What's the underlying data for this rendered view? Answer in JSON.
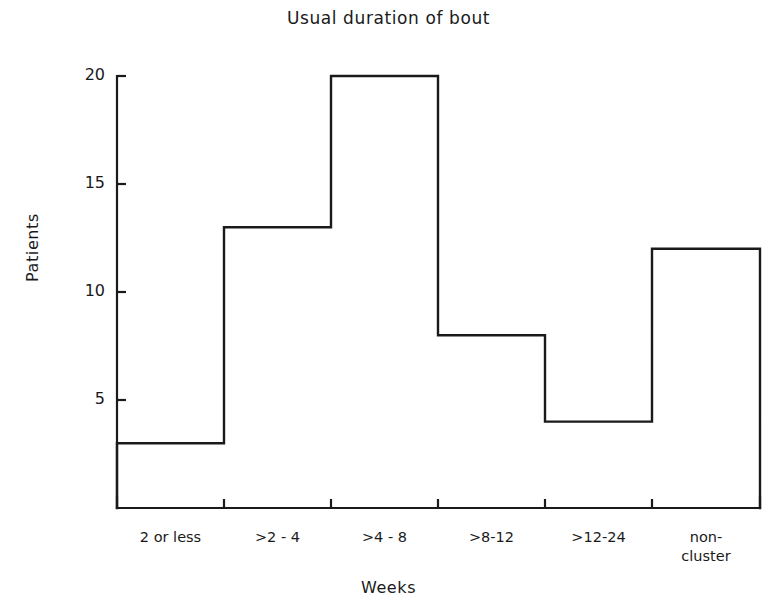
{
  "chart_data": {
    "type": "bar",
    "render_style": "step-outline-histogram",
    "title": "Usual duration of bout",
    "xlabel": "Weeks",
    "ylabel": "Patients",
    "categories": [
      "2 or less",
      ">2 - 4",
      ">4 - 8",
      ">8-12",
      ">12-24",
      "non-\ncluster"
    ],
    "values": [
      3,
      13,
      20,
      8,
      4,
      12
    ],
    "ylim": [
      0,
      20.5
    ],
    "yticks": [
      5,
      10,
      15,
      20
    ],
    "ytick_labels": [
      "5",
      "10",
      "15",
      "20"
    ],
    "grid": false,
    "legend": null,
    "line_color": "#1a1a1a",
    "fill_color": "none",
    "background_color": "#ffffff"
  },
  "geometry": {
    "x_edges": [
      117,
      224,
      331,
      438,
      545,
      652,
      760
    ],
    "y_baseline": 508,
    "y_top_axis": 76,
    "px_per_unit": 21.6,
    "tick_inner_length": 9,
    "xtick_length": 9
  },
  "axis": {
    "x_title": "Weeks",
    "y_title": "Patients"
  }
}
